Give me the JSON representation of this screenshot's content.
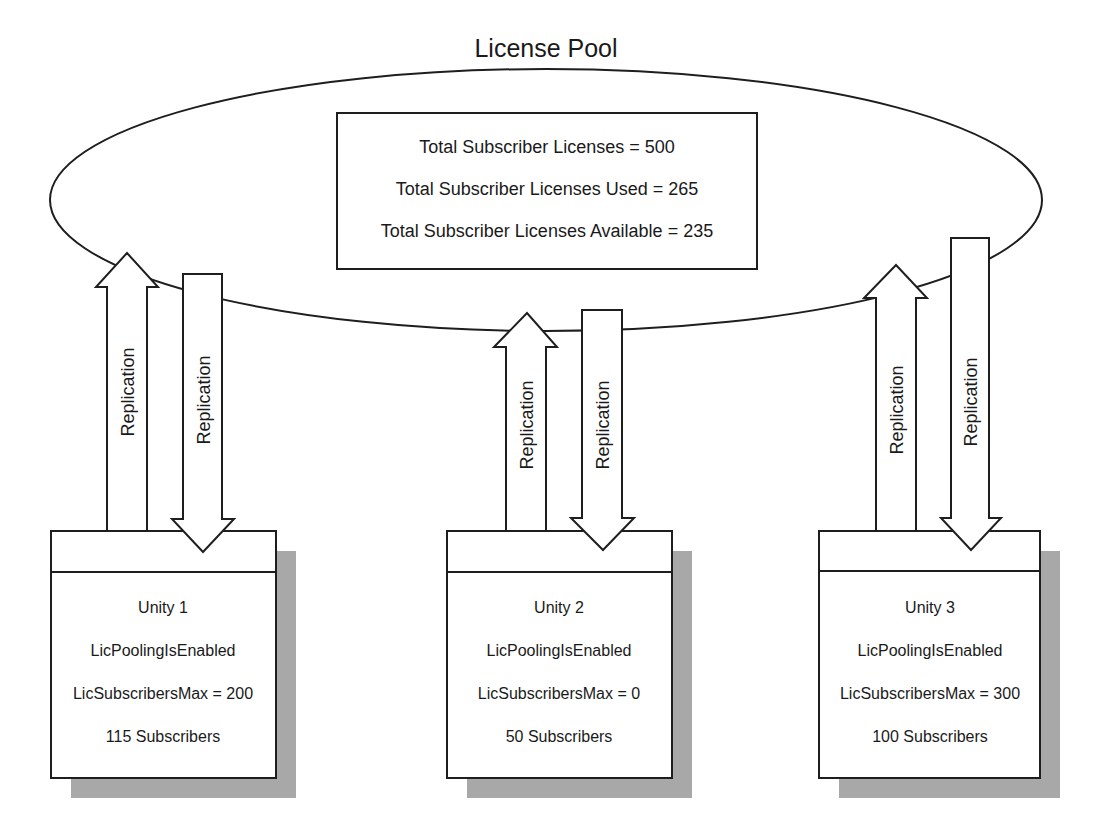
{
  "title": "License Pool",
  "pool": {
    "total": "Total Subscriber Licenses = 500",
    "used": "Total Subscriber Licenses Used = 265",
    "available": "Total Subscriber Licenses Available = 235"
  },
  "arrow_label": "Replication",
  "servers": [
    {
      "name": "Unity 1",
      "pooling": "LicPoolingIsEnabled",
      "max": "LicSubscribersMax = 200",
      "subscribers": "115 Subscribers"
    },
    {
      "name": "Unity 2",
      "pooling": "LicPoolingIsEnabled",
      "max": "LicSubscribersMax = 0",
      "subscribers": "50 Subscribers"
    },
    {
      "name": "Unity 3",
      "pooling": "LicPoolingIsEnabled",
      "max": "LicSubscribersMax = 300",
      "subscribers": "100 Subscribers"
    }
  ],
  "colors": {
    "line": "#1e1e1e",
    "shadow": "#a8a8a8",
    "background": "#ffffff"
  }
}
